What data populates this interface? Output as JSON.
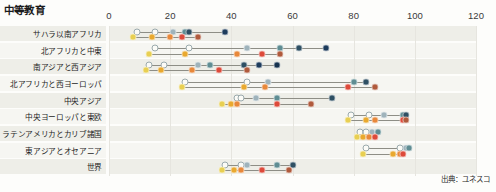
{
  "chart": {
    "title": "中等教育",
    "source_note": "出典：ユネスコ"
  },
  "chart_data": {
    "type": "scatter",
    "title": "中等教育",
    "subtitle": "",
    "xlabel": "",
    "ylabel": "",
    "xlim": [
      0,
      120
    ],
    "xticks": [
      0,
      20,
      40,
      60,
      80,
      100,
      120
    ],
    "tick_labels": [
      "0",
      "20",
      "40",
      "60",
      "80",
      "100",
      "120"
    ],
    "grid": "vertical",
    "legend": "none",
    "orientation": "horizontal",
    "annotations": [
      "出典：ユネスコ"
    ],
    "categories": [
      "サハラ以南アフリカ",
      "北アフリカと中東",
      "南アジアと西アジア",
      "北アフリカと西ヨーロッパ",
      "中央アジア",
      "中央ヨーロッパと東欧",
      "ラテンアメリカとカリブ諸国",
      "東アジアとオセアニア",
      "世界"
    ],
    "series": [
      {
        "name": "upper-row",
        "palette": [
          "#fbfbf7",
          "#fbfbf7",
          "#9fb3bb",
          "#5f8d93",
          "#2e4f63",
          "#1d3b5c",
          "#16324e"
        ],
        "rows": [
          [
            9,
            15,
            21,
            25,
            26,
            38
          ],
          [
            15,
            26,
            45,
            56,
            62,
            71
          ],
          [
            13,
            18,
            29,
            33,
            44,
            49,
            55
          ],
          [
            25,
            45,
            52,
            80,
            84
          ],
          [
            42,
            43,
            48,
            55,
            73
          ],
          [
            79,
            85,
            90,
            96,
            97
          ],
          [
            82,
            84,
            86,
            88
          ],
          [
            84,
            95,
            97,
            98
          ],
          [
            38,
            43,
            45,
            55,
            60
          ]
        ]
      },
      {
        "name": "lower-row",
        "palette": [
          "#e8cf52",
          "#e9a92f",
          "#e8883a",
          "#dd4a3a",
          "#b05a3c",
          "#9b4a33"
        ],
        "rows": [
          [
            8,
            14,
            20,
            24,
            29
          ],
          [
            13,
            25,
            42,
            50,
            56
          ],
          [
            12,
            17,
            27,
            36,
            45
          ],
          [
            24,
            44,
            51,
            78,
            87
          ],
          [
            37,
            40,
            42,
            55,
            66
          ],
          [
            78,
            84,
            87,
            96,
            97
          ],
          [
            81,
            83,
            85,
            87
          ],
          [
            83,
            93,
            95,
            96
          ],
          [
            37,
            41,
            43,
            50,
            59
          ]
        ]
      }
    ]
  }
}
